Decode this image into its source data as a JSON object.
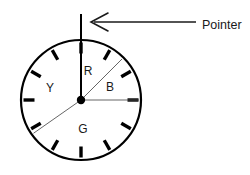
{
  "figure": {
    "background_color": "#ffffff",
    "stroke_color": "#000000",
    "label_color": "#1a1a1a",
    "thin_line_color": "#555555"
  },
  "wheel": {
    "center_x": 81,
    "center_y": 100,
    "radius": 60,
    "rim_stroke_width": 2.2,
    "hub_radius": 4.2,
    "tick_count": 12,
    "tick_length": 11,
    "tick_width": 3.4,
    "tick_angles_deg": [
      0,
      30,
      60,
      90,
      120,
      150,
      180,
      210,
      240,
      270,
      300,
      330
    ]
  },
  "pointer": {
    "label": "Pointer",
    "line_x": 81,
    "line_top_y": 14,
    "line_bottom_y": 100,
    "arrow_tip_x": 92,
    "arrow_tip_y": 22,
    "arrow_tail_x": 196,
    "arrow_tail_y": 22,
    "label_x": 202,
    "label_y": 26
  },
  "sectors": [
    {
      "name": "red-sector",
      "label": "R",
      "start_angle_deg": 270,
      "end_angle_deg": 315,
      "label_x": 88,
      "label_y": 72
    },
    {
      "name": "blue-sector",
      "label": "B",
      "start_angle_deg": 315,
      "end_angle_deg": 0,
      "label_x": 110,
      "label_y": 88
    },
    {
      "name": "green-sector",
      "label": "G",
      "start_angle_deg": 0,
      "end_angle_deg": 145,
      "label_x": 83,
      "label_y": 130
    },
    {
      "name": "yellow-sector",
      "label": "Y",
      "start_angle_deg": 145,
      "end_angle_deg": 270,
      "label_x": 50,
      "label_y": 89
    }
  ],
  "divider_lines": [
    {
      "name": "divider-to-top",
      "angle_deg": 270,
      "length": 60
    },
    {
      "name": "divider-to-upper-right",
      "angle_deg": 315,
      "length": 60
    },
    {
      "name": "divider-to-right",
      "angle_deg": 0,
      "length": 60
    },
    {
      "name": "divider-to-lower-left",
      "angle_deg": 145,
      "length": 60
    }
  ]
}
